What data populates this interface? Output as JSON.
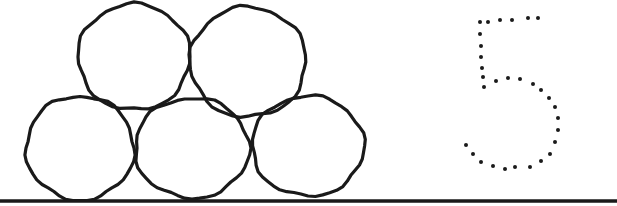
{
  "worksheet": {
    "number": "5",
    "count": 5,
    "colors": {
      "ink": "#1a1a1a",
      "background": "#ffffff"
    },
    "circles": [
      {
        "name": "bottom-left",
        "cx": 80,
        "cy": 148,
        "rx": 54,
        "ry": 52
      },
      {
        "name": "bottom-middle",
        "cx": 192,
        "cy": 148,
        "rx": 57,
        "ry": 50
      },
      {
        "name": "bottom-right",
        "cx": 308,
        "cy": 146,
        "rx": 56,
        "ry": 50
      },
      {
        "name": "top-left",
        "cx": 134,
        "cy": 57,
        "rx": 56,
        "ry": 53
      },
      {
        "name": "top-right",
        "cx": 248,
        "cy": 62,
        "rx": 58,
        "ry": 55
      }
    ],
    "baseline": {
      "x1": 0,
      "x2": 617,
      "y": 201
    },
    "dots": [
      [
        480,
        22
      ],
      [
        488,
        22
      ],
      [
        500,
        20
      ],
      [
        512,
        20
      ],
      [
        528,
        18
      ],
      [
        538,
        18
      ],
      [
        480,
        34
      ],
      [
        481,
        46
      ],
      [
        481,
        57
      ],
      [
        482,
        68
      ],
      [
        483,
        77
      ],
      [
        484,
        87
      ],
      [
        496,
        81
      ],
      [
        508,
        78
      ],
      [
        520,
        79
      ],
      [
        533,
        84
      ],
      [
        541,
        90
      ],
      [
        549,
        98
      ],
      [
        555,
        107
      ],
      [
        558,
        118
      ],
      [
        558,
        130
      ],
      [
        555,
        142
      ],
      [
        550,
        154
      ],
      [
        541,
        161
      ],
      [
        530,
        167
      ],
      [
        515,
        167
      ],
      [
        505,
        169
      ],
      [
        493,
        166
      ],
      [
        481,
        162
      ],
      [
        473,
        154
      ],
      [
        466,
        145
      ]
    ]
  }
}
